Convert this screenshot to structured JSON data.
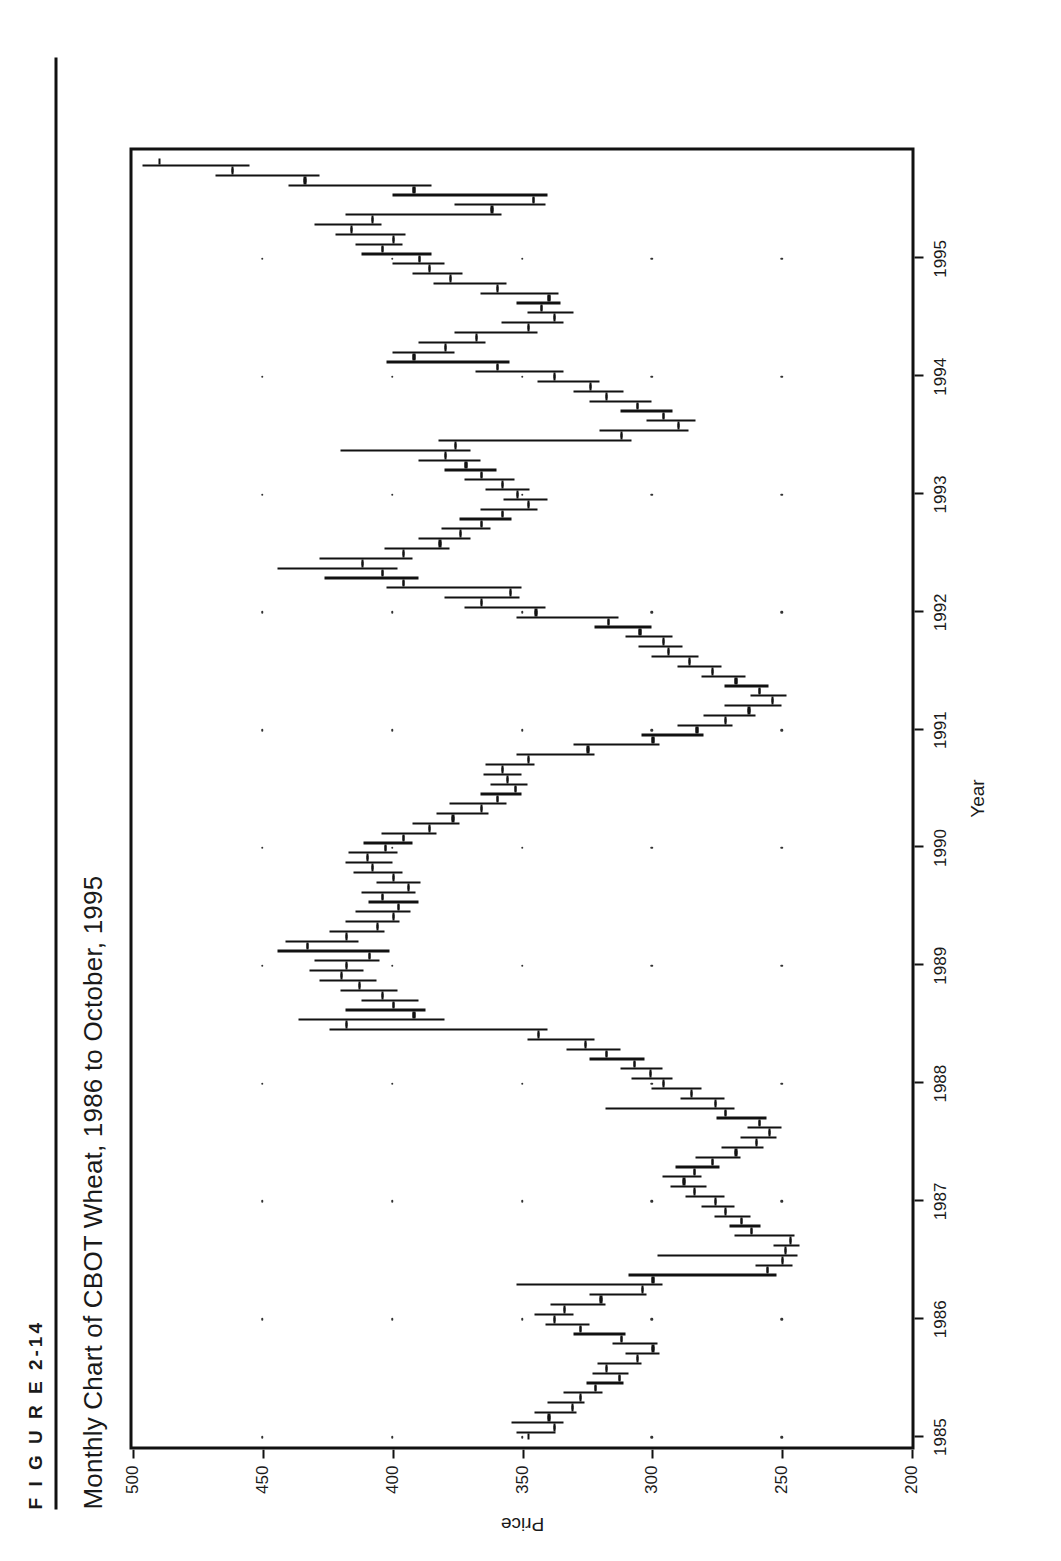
{
  "figure": {
    "kicker": "F I G U R E   2-14",
    "title": "Monthly Chart of CBOT Wheat, 1986 to October, 1995"
  },
  "chart_data": {
    "type": "ohlc",
    "title": "Monthly Chart of CBOT Wheat, 1986 to October, 1995",
    "xlabel": "Year",
    "ylabel": "Price",
    "xlim": [
      1984.92,
      1995.92
    ],
    "ylim": [
      200,
      500
    ],
    "y_ticks": [
      500,
      450,
      400,
      350,
      300,
      250,
      200
    ],
    "x_ticks": [
      1985,
      1986,
      1987,
      1988,
      1989,
      1990,
      1991,
      1992,
      1993,
      1994,
      1995
    ],
    "grid": "dotted",
    "grid_style": "dot-matrix at tick intersections",
    "legend": "none",
    "series_name": "CBOT Wheat monthly OHLC",
    "columns": [
      "date",
      "open",
      "high",
      "low",
      "close"
    ],
    "bars": [
      {
        "date": "1985-01",
        "open": 348,
        "high": 352,
        "low": 337,
        "close": 338
      },
      {
        "date": "1985-02",
        "open": 338,
        "high": 354,
        "low": 334,
        "close": 340
      },
      {
        "date": "1985-03",
        "open": 340,
        "high": 345,
        "low": 329,
        "close": 331
      },
      {
        "date": "1985-04",
        "open": 331,
        "high": 340,
        "low": 326,
        "close": 328
      },
      {
        "date": "1985-05",
        "open": 328,
        "high": 334,
        "low": 319,
        "close": 322
      },
      {
        "date": "1985-06",
        "open": 322,
        "high": 325,
        "low": 311,
        "close": 313
      },
      {
        "date": "1985-07",
        "open": 313,
        "high": 323,
        "low": 309,
        "close": 318
      },
      {
        "date": "1985-08",
        "open": 318,
        "high": 321,
        "low": 304,
        "close": 306
      },
      {
        "date": "1985-09",
        "open": 306,
        "high": 310,
        "low": 297,
        "close": 300
      },
      {
        "date": "1985-10",
        "open": 300,
        "high": 315,
        "low": 298,
        "close": 312
      },
      {
        "date": "1985-11",
        "open": 312,
        "high": 330,
        "low": 310,
        "close": 328
      },
      {
        "date": "1985-12",
        "open": 328,
        "high": 341,
        "low": 324,
        "close": 338
      },
      {
        "date": "1986-01",
        "open": 338,
        "high": 345,
        "low": 330,
        "close": 334
      },
      {
        "date": "1986-02",
        "open": 334,
        "high": 339,
        "low": 318,
        "close": 320
      },
      {
        "date": "1986-03",
        "open": 320,
        "high": 324,
        "low": 302,
        "close": 304
      },
      {
        "date": "1986-04",
        "open": 304,
        "high": 352,
        "low": 296,
        "close": 300
      },
      {
        "date": "1986-05",
        "open": 300,
        "high": 309,
        "low": 252,
        "close": 256
      },
      {
        "date": "1986-06",
        "open": 256,
        "high": 260,
        "low": 246,
        "close": 250
      },
      {
        "date": "1986-07",
        "open": 250,
        "high": 298,
        "low": 244,
        "close": 249
      },
      {
        "date": "1986-08",
        "open": 249,
        "high": 253,
        "low": 243,
        "close": 247
      },
      {
        "date": "1986-09",
        "open": 247,
        "high": 268,
        "low": 245,
        "close": 262
      },
      {
        "date": "1986-10",
        "open": 262,
        "high": 270,
        "low": 258,
        "close": 266
      },
      {
        "date": "1986-11",
        "open": 266,
        "high": 276,
        "low": 262,
        "close": 272
      },
      {
        "date": "1986-12",
        "open": 272,
        "high": 281,
        "low": 268,
        "close": 276
      },
      {
        "date": "1987-01",
        "open": 276,
        "high": 287,
        "low": 272,
        "close": 284
      },
      {
        "date": "1987-02",
        "open": 284,
        "high": 293,
        "low": 279,
        "close": 288
      },
      {
        "date": "1987-03",
        "open": 288,
        "high": 296,
        "low": 281,
        "close": 284
      },
      {
        "date": "1987-04",
        "open": 284,
        "high": 291,
        "low": 274,
        "close": 277
      },
      {
        "date": "1987-05",
        "open": 277,
        "high": 283,
        "low": 266,
        "close": 268
      },
      {
        "date": "1987-06",
        "open": 268,
        "high": 273,
        "low": 257,
        "close": 260
      },
      {
        "date": "1987-07",
        "open": 260,
        "high": 266,
        "low": 252,
        "close": 255
      },
      {
        "date": "1987-08",
        "open": 255,
        "high": 263,
        "low": 250,
        "close": 259
      },
      {
        "date": "1987-09",
        "open": 259,
        "high": 275,
        "low": 256,
        "close": 272
      },
      {
        "date": "1987-10",
        "open": 272,
        "high": 318,
        "low": 268,
        "close": 276
      },
      {
        "date": "1987-11",
        "open": 276,
        "high": 289,
        "low": 272,
        "close": 285
      },
      {
        "date": "1987-12",
        "open": 285,
        "high": 300,
        "low": 281,
        "close": 296
      },
      {
        "date": "1988-01",
        "open": 296,
        "high": 308,
        "low": 292,
        "close": 301
      },
      {
        "date": "1988-02",
        "open": 301,
        "high": 312,
        "low": 296,
        "close": 307
      },
      {
        "date": "1988-03",
        "open": 307,
        "high": 324,
        "low": 303,
        "close": 318
      },
      {
        "date": "1988-04",
        "open": 318,
        "high": 333,
        "low": 312,
        "close": 326
      },
      {
        "date": "1988-05",
        "open": 326,
        "high": 348,
        "low": 322,
        "close": 344
      },
      {
        "date": "1988-06",
        "open": 344,
        "high": 424,
        "low": 340,
        "close": 418
      },
      {
        "date": "1988-07",
        "open": 418,
        "high": 436,
        "low": 380,
        "close": 392
      },
      {
        "date": "1988-08",
        "open": 392,
        "high": 418,
        "low": 387,
        "close": 400
      },
      {
        "date": "1988-09",
        "open": 400,
        "high": 412,
        "low": 390,
        "close": 404
      },
      {
        "date": "1988-10",
        "open": 404,
        "high": 420,
        "low": 398,
        "close": 413
      },
      {
        "date": "1988-11",
        "open": 413,
        "high": 428,
        "low": 406,
        "close": 420
      },
      {
        "date": "1988-12",
        "open": 420,
        "high": 432,
        "low": 411,
        "close": 418
      },
      {
        "date": "1989-01",
        "open": 418,
        "high": 430,
        "low": 405,
        "close": 409
      },
      {
        "date": "1989-02",
        "open": 409,
        "high": 444,
        "low": 401,
        "close": 433
      },
      {
        "date": "1989-03",
        "open": 433,
        "high": 441,
        "low": 413,
        "close": 418
      },
      {
        "date": "1989-04",
        "open": 418,
        "high": 424,
        "low": 403,
        "close": 406
      },
      {
        "date": "1989-05",
        "open": 406,
        "high": 418,
        "low": 397,
        "close": 400
      },
      {
        "date": "1989-06",
        "open": 400,
        "high": 414,
        "low": 393,
        "close": 398
      },
      {
        "date": "1989-07",
        "open": 398,
        "high": 409,
        "low": 390,
        "close": 404
      },
      {
        "date": "1989-08",
        "open": 404,
        "high": 412,
        "low": 391,
        "close": 394
      },
      {
        "date": "1989-09",
        "open": 394,
        "high": 406,
        "low": 389,
        "close": 400
      },
      {
        "date": "1989-10",
        "open": 400,
        "high": 415,
        "low": 396,
        "close": 408
      },
      {
        "date": "1989-11",
        "open": 408,
        "high": 418,
        "low": 400,
        "close": 410
      },
      {
        "date": "1989-12",
        "open": 410,
        "high": 417,
        "low": 398,
        "close": 403
      },
      {
        "date": "1990-01",
        "open": 403,
        "high": 411,
        "low": 392,
        "close": 396
      },
      {
        "date": "1990-02",
        "open": 396,
        "high": 404,
        "low": 383,
        "close": 386
      },
      {
        "date": "1990-03",
        "open": 386,
        "high": 392,
        "low": 374,
        "close": 377
      },
      {
        "date": "1990-04",
        "open": 377,
        "high": 383,
        "low": 363,
        "close": 366
      },
      {
        "date": "1990-05",
        "open": 366,
        "high": 378,
        "low": 356,
        "close": 360
      },
      {
        "date": "1990-06",
        "open": 360,
        "high": 366,
        "low": 350,
        "close": 353
      },
      {
        "date": "1990-07",
        "open": 353,
        "high": 362,
        "low": 348,
        "close": 356
      },
      {
        "date": "1990-08",
        "open": 356,
        "high": 365,
        "low": 350,
        "close": 358
      },
      {
        "date": "1990-09",
        "open": 358,
        "high": 364,
        "low": 345,
        "close": 348
      },
      {
        "date": "1990-10",
        "open": 348,
        "high": 352,
        "low": 322,
        "close": 325
      },
      {
        "date": "1990-11",
        "open": 325,
        "high": 330,
        "low": 297,
        "close": 300
      },
      {
        "date": "1990-12",
        "open": 300,
        "high": 304,
        "low": 280,
        "close": 283
      },
      {
        "date": "1991-01",
        "open": 283,
        "high": 290,
        "low": 269,
        "close": 272
      },
      {
        "date": "1991-02",
        "open": 272,
        "high": 280,
        "low": 260,
        "close": 263
      },
      {
        "date": "1991-03",
        "open": 263,
        "high": 272,
        "low": 250,
        "close": 254
      },
      {
        "date": "1991-04",
        "open": 254,
        "high": 262,
        "low": 248,
        "close": 259
      },
      {
        "date": "1991-05",
        "open": 259,
        "high": 272,
        "low": 255,
        "close": 268
      },
      {
        "date": "1991-06",
        "open": 268,
        "high": 281,
        "low": 264,
        "close": 277
      },
      {
        "date": "1991-07",
        "open": 277,
        "high": 290,
        "low": 273,
        "close": 286
      },
      {
        "date": "1991-08",
        "open": 286,
        "high": 300,
        "low": 282,
        "close": 294
      },
      {
        "date": "1991-09",
        "open": 294,
        "high": 305,
        "low": 288,
        "close": 296
      },
      {
        "date": "1991-10",
        "open": 296,
        "high": 310,
        "low": 292,
        "close": 305
      },
      {
        "date": "1991-11",
        "open": 305,
        "high": 322,
        "low": 300,
        "close": 317
      },
      {
        "date": "1991-12",
        "open": 317,
        "high": 352,
        "low": 313,
        "close": 345
      },
      {
        "date": "1992-01",
        "open": 345,
        "high": 372,
        "low": 341,
        "close": 366
      },
      {
        "date": "1992-02",
        "open": 366,
        "high": 380,
        "low": 351,
        "close": 355
      },
      {
        "date": "1992-03",
        "open": 355,
        "high": 402,
        "low": 350,
        "close": 396
      },
      {
        "date": "1992-04",
        "open": 396,
        "high": 426,
        "low": 390,
        "close": 404
      },
      {
        "date": "1992-05",
        "open": 404,
        "high": 444,
        "low": 398,
        "close": 412
      },
      {
        "date": "1992-06",
        "open": 412,
        "high": 428,
        "low": 392,
        "close": 396
      },
      {
        "date": "1992-07",
        "open": 396,
        "high": 403,
        "low": 378,
        "close": 382
      },
      {
        "date": "1992-08",
        "open": 382,
        "high": 390,
        "low": 370,
        "close": 374
      },
      {
        "date": "1992-09",
        "open": 374,
        "high": 381,
        "low": 362,
        "close": 366
      },
      {
        "date": "1992-10",
        "open": 366,
        "high": 374,
        "low": 354,
        "close": 358
      },
      {
        "date": "1992-11",
        "open": 358,
        "high": 366,
        "low": 344,
        "close": 348
      },
      {
        "date": "1992-12",
        "open": 348,
        "high": 357,
        "low": 340,
        "close": 352
      },
      {
        "date": "1993-01",
        "open": 352,
        "high": 364,
        "low": 347,
        "close": 358
      },
      {
        "date": "1993-02",
        "open": 358,
        "high": 372,
        "low": 353,
        "close": 366
      },
      {
        "date": "1993-03",
        "open": 366,
        "high": 380,
        "low": 360,
        "close": 372
      },
      {
        "date": "1993-04",
        "open": 372,
        "high": 390,
        "low": 366,
        "close": 380
      },
      {
        "date": "1993-05",
        "open": 380,
        "high": 420,
        "low": 370,
        "close": 376
      },
      {
        "date": "1993-06",
        "open": 376,
        "high": 382,
        "low": 308,
        "close": 312
      },
      {
        "date": "1993-07",
        "open": 312,
        "high": 320,
        "low": 286,
        "close": 290
      },
      {
        "date": "1993-08",
        "open": 290,
        "high": 302,
        "low": 283,
        "close": 296
      },
      {
        "date": "1993-09",
        "open": 296,
        "high": 312,
        "low": 292,
        "close": 306
      },
      {
        "date": "1993-10",
        "open": 306,
        "high": 324,
        "low": 300,
        "close": 318
      },
      {
        "date": "1993-11",
        "open": 318,
        "high": 330,
        "low": 311,
        "close": 324
      },
      {
        "date": "1993-12",
        "open": 324,
        "high": 344,
        "low": 320,
        "close": 338
      },
      {
        "date": "1994-01",
        "open": 338,
        "high": 368,
        "low": 334,
        "close": 360
      },
      {
        "date": "1994-02",
        "open": 360,
        "high": 402,
        "low": 355,
        "close": 392
      },
      {
        "date": "1994-03",
        "open": 392,
        "high": 400,
        "low": 376,
        "close": 380
      },
      {
        "date": "1994-04",
        "open": 380,
        "high": 390,
        "low": 364,
        "close": 368
      },
      {
        "date": "1994-05",
        "open": 368,
        "high": 376,
        "low": 344,
        "close": 348
      },
      {
        "date": "1994-06",
        "open": 348,
        "high": 358,
        "low": 334,
        "close": 338
      },
      {
        "date": "1994-07",
        "open": 338,
        "high": 348,
        "low": 330,
        "close": 343
      },
      {
        "date": "1994-08",
        "open": 343,
        "high": 352,
        "low": 335,
        "close": 340
      },
      {
        "date": "1994-09",
        "open": 340,
        "high": 366,
        "low": 336,
        "close": 360
      },
      {
        "date": "1994-10",
        "open": 360,
        "high": 384,
        "low": 356,
        "close": 378
      },
      {
        "date": "1994-11",
        "open": 378,
        "high": 392,
        "low": 373,
        "close": 386
      },
      {
        "date": "1994-12",
        "open": 386,
        "high": 400,
        "low": 380,
        "close": 390
      },
      {
        "date": "1995-01",
        "open": 390,
        "high": 412,
        "low": 385,
        "close": 404
      },
      {
        "date": "1995-02",
        "open": 404,
        "high": 414,
        "low": 396,
        "close": 400
      },
      {
        "date": "1995-03",
        "open": 400,
        "high": 422,
        "low": 395,
        "close": 416
      },
      {
        "date": "1995-04",
        "open": 416,
        "high": 430,
        "low": 404,
        "close": 408
      },
      {
        "date": "1995-05",
        "open": 408,
        "high": 418,
        "low": 358,
        "close": 362
      },
      {
        "date": "1995-06",
        "open": 362,
        "high": 376,
        "low": 341,
        "close": 346
      },
      {
        "date": "1995-07",
        "open": 346,
        "high": 400,
        "low": 340,
        "close": 392
      },
      {
        "date": "1995-08",
        "open": 392,
        "high": 440,
        "low": 385,
        "close": 434
      },
      {
        "date": "1995-09",
        "open": 434,
        "high": 468,
        "low": 428,
        "close": 462
      },
      {
        "date": "1995-10",
        "open": 462,
        "high": 496,
        "low": 455,
        "close": 490
      }
    ]
  },
  "axes": {
    "y_tick_labels": [
      "500",
      "450",
      "400",
      "350",
      "300",
      "250",
      "200"
    ],
    "x_tick_labels": [
      "1985",
      "1986",
      "1987",
      "1988",
      "1989",
      "1990",
      "1991",
      "1992",
      "1993",
      "1994",
      "1995"
    ],
    "y_title": "Price",
    "x_title": "Year"
  }
}
